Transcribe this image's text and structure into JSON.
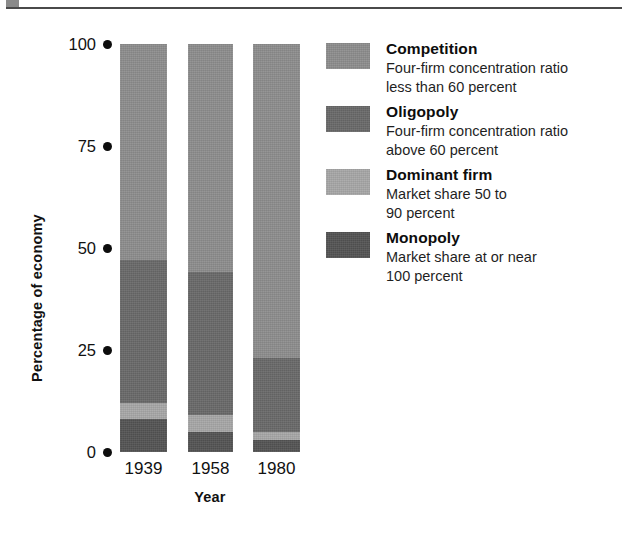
{
  "figure": {
    "top_rule": {
      "name": "horizontal-rule",
      "color": "#4a4a4a",
      "tab_color": "#8a8a8a"
    }
  },
  "chart_data": {
    "type": "bar",
    "subtype": "stacked-bar-100",
    "title": "",
    "xlabel": "Year",
    "ylabel": "Percentage of economy",
    "categories": [
      "1939",
      "1958",
      "1980"
    ],
    "ylim": [
      0,
      100
    ],
    "yticks": [
      0,
      25,
      50,
      75,
      100
    ],
    "ytick_labels": [
      "0",
      "25",
      "50",
      "75",
      "100"
    ],
    "grid": false,
    "legend_position": "right",
    "stack_order_bottom_to_top": [
      "Monopoly",
      "Dominant firm",
      "Oligopoly",
      "Competition"
    ],
    "series": [
      {
        "name": "Competition",
        "color": "#8e8e8e",
        "values": [
          53,
          56,
          77
        ]
      },
      {
        "name": "Oligopoly",
        "color": "#6a6a6a",
        "values": [
          35,
          35,
          18
        ]
      },
      {
        "name": "Dominant firm",
        "color": "#a8a8a8",
        "values": [
          4,
          4,
          2
        ]
      },
      {
        "name": "Monopoly",
        "color": "#555555",
        "values": [
          8,
          5,
          3
        ]
      }
    ],
    "legend": [
      {
        "label": "Competition",
        "description": "Four-firm concentration ratio\nless than 60 percent",
        "color": "#8e8e8e"
      },
      {
        "label": "Oligopoly",
        "description": "Four-firm concentration ratio\nabove 60 percent",
        "color": "#6a6a6a"
      },
      {
        "label": "Dominant firm",
        "description": "Market share 50 to\n90 percent",
        "color": "#a8a8a8"
      },
      {
        "label": "Monopoly",
        "description": "Market share at or near\n100 percent",
        "color": "#555555"
      }
    ]
  }
}
